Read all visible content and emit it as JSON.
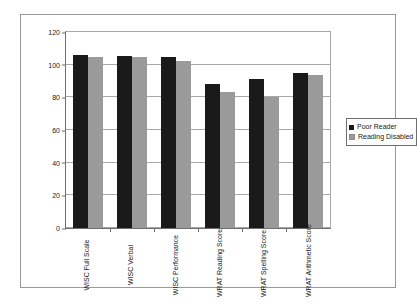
{
  "chart_data": {
    "type": "bar",
    "title": "",
    "subtitle": "",
    "xlabel": "",
    "ylabel": "",
    "ylim": [
      0,
      120
    ],
    "yticks": [
      0,
      20,
      40,
      60,
      80,
      100,
      120
    ],
    "grid": true,
    "legend_position": "right",
    "categories": [
      "WISC Full Scale",
      "WISC Verbal",
      "WISC Performance",
      "WRAT Reading Score",
      "WRAT Spelling Score",
      "WRAT Arithmetic Score"
    ],
    "series": [
      {
        "name": "Poor Reader",
        "color": "#1a1a1a",
        "values": [
          106,
          105.5,
          105,
          88,
          91,
          95
        ]
      },
      {
        "name": "Reading Disabled",
        "color": "#9a9a9a",
        "values": [
          104.5,
          104.5,
          102.5,
          83.5,
          80.5,
          93.5
        ]
      }
    ]
  },
  "colors": {
    "poor_reader": "#1a1a1a",
    "reading_disabled": "#9a9a9a",
    "gridline": "#a8a8a8",
    "axis": "#6e6e6e",
    "frame": "#9a9a9a",
    "background": "#ffffff"
  }
}
